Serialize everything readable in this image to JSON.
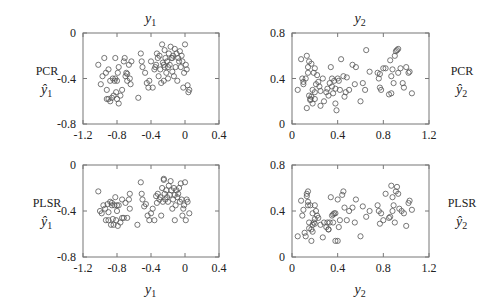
{
  "figure": {
    "panels_layout": "2x2",
    "marker": "open-circle",
    "marker_color": "#555555",
    "axis_color": "#777777",
    "text_color": "#222222"
  },
  "chart_data": [
    {
      "type": "scatter",
      "panel": "top-left",
      "title": "y1",
      "title_display": "y",
      "title_sub": "1",
      "row_label": "PCR",
      "row_label_math": "ŷ1",
      "row_label_math_base": "ŷ",
      "row_label_math_sub": "1",
      "row_label_side": "left",
      "xlabel": "",
      "ylabel": "PCR ŷ1",
      "xlim": [
        -1.2,
        0.4
      ],
      "ylim": [
        -0.8,
        0
      ],
      "xticks": [
        -1.2,
        -0.8,
        -0.4,
        0,
        0.4
      ],
      "xtick_labels": [
        "-1.2",
        "-0.8",
        "-0.4",
        "0",
        "0.4"
      ],
      "yticks": [
        0,
        -0.4,
        -0.8
      ],
      "ytick_labels": [
        "0",
        "-0.4",
        "-0.8"
      ],
      "grid": false,
      "x": [
        -1.02,
        -0.99,
        -0.97,
        -0.95,
        -0.93,
        -0.92,
        -0.9,
        -0.88,
        -0.86,
        -0.85,
        -0.84,
        -0.83,
        -0.82,
        -0.81,
        -0.8,
        -0.8,
        -0.79,
        -0.78,
        -0.76,
        -0.74,
        -0.72,
        -0.71,
        -0.7,
        -0.69,
        -0.68,
        -0.66,
        -0.65,
        -0.64,
        -0.63,
        -0.55,
        -0.52,
        -0.51,
        -0.5,
        -0.47,
        -0.45,
        -0.43,
        -0.42,
        -0.4,
        -0.38,
        -0.36,
        -0.34,
        -0.33,
        -0.32,
        -0.31,
        -0.3,
        -0.29,
        -0.28,
        -0.27,
        -0.26,
        -0.25,
        -0.24,
        -0.24,
        -0.23,
        -0.22,
        -0.21,
        -0.2,
        -0.2,
        -0.19,
        -0.18,
        -0.17,
        -0.16,
        -0.15,
        -0.14,
        -0.13,
        -0.12,
        -0.11,
        -0.1,
        -0.09,
        -0.08,
        -0.07,
        -0.06,
        -0.05,
        -0.04,
        -0.03,
        -0.02,
        -0.01,
        0,
        0.01,
        0.02,
        0.03,
        0.04,
        0.05,
        -0.88,
        -0.9,
        -0.82,
        -0.78,
        -0.92,
        -0.68,
        -0.25,
        -0.35,
        -0.15
      ],
      "y": [
        -0.28,
        -0.45,
        -0.38,
        -0.22,
        -0.35,
        -0.58,
        -0.32,
        -0.42,
        -0.57,
        -0.4,
        -0.55,
        -0.42,
        -0.22,
        -0.52,
        -0.42,
        -0.58,
        -0.35,
        -0.3,
        -0.55,
        -0.5,
        -0.25,
        -0.22,
        -0.38,
        -0.35,
        -0.42,
        -0.28,
        -0.4,
        -0.45,
        -0.25,
        -0.57,
        -0.18,
        -0.25,
        -0.3,
        -0.35,
        -0.44,
        -0.48,
        -0.42,
        -0.25,
        -0.48,
        -0.32,
        -0.28,
        -0.18,
        -0.22,
        -0.38,
        -0.2,
        -0.32,
        -0.44,
        -0.1,
        -0.26,
        -0.28,
        -0.15,
        -0.3,
        -0.22,
        -0.35,
        -0.25,
        -0.3,
        -0.4,
        -0.18,
        -0.28,
        -0.12,
        -0.22,
        -0.34,
        -0.2,
        -0.38,
        -0.14,
        -0.3,
        -0.18,
        -0.42,
        -0.22,
        -0.25,
        -0.16,
        -0.3,
        -0.2,
        -0.25,
        -0.48,
        -0.35,
        -0.1,
        -0.28,
        -0.32,
        -0.46,
        -0.52,
        -0.5,
        -0.6,
        -0.58,
        -0.4,
        -0.62,
        -0.5,
        -0.36,
        -0.42,
        -0.3,
        -0.22
      ]
    },
    {
      "type": "scatter",
      "panel": "top-right",
      "title": "y2",
      "title_display": "y",
      "title_sub": "2",
      "row_label": "PCR",
      "row_label_math": "ŷ2",
      "row_label_math_base": "ŷ",
      "row_label_math_sub": "2",
      "row_label_side": "right",
      "xlabel": "",
      "ylabel": "PCR ŷ2",
      "xlim": [
        0,
        1.2
      ],
      "ylim": [
        0,
        0.8
      ],
      "xticks": [
        0,
        0.4,
        0.8,
        1.2
      ],
      "xtick_labels": [
        "0",
        "0.4",
        "0.8",
        "1.2"
      ],
      "yticks": [
        0,
        0.4,
        0.8
      ],
      "ytick_labels": [
        "0",
        "0.4",
        "0.8"
      ],
      "grid": false,
      "x": [
        0.05,
        0.08,
        0.09,
        0.1,
        0.12,
        0.13,
        0.13,
        0.14,
        0.15,
        0.15,
        0.16,
        0.16,
        0.17,
        0.18,
        0.18,
        0.19,
        0.2,
        0.2,
        0.21,
        0.22,
        0.23,
        0.24,
        0.25,
        0.27,
        0.28,
        0.3,
        0.31,
        0.32,
        0.33,
        0.34,
        0.35,
        0.35,
        0.36,
        0.37,
        0.38,
        0.39,
        0.4,
        0.41,
        0.42,
        0.43,
        0.45,
        0.46,
        0.47,
        0.48,
        0.5,
        0.53,
        0.55,
        0.56,
        0.6,
        0.62,
        0.64,
        0.65,
        0.68,
        0.75,
        0.76,
        0.77,
        0.78,
        0.8,
        0.82,
        0.85,
        0.86,
        0.87,
        0.88,
        0.89,
        0.9,
        0.91,
        0.92,
        0.93,
        0.95,
        0.97,
        0.98,
        1.0,
        1.02,
        1.03,
        1.05,
        0.14,
        0.1,
        0.17,
        0.25,
        0.38,
        0.77,
        0.87,
        0.93,
        0.2
      ],
      "y": [
        0.3,
        0.57,
        0.4,
        0.35,
        0.4,
        0.6,
        0.14,
        0.5,
        0.25,
        0.55,
        0.22,
        0.21,
        0.53,
        0.18,
        0.3,
        0.45,
        0.28,
        0.49,
        0.35,
        0.43,
        0.37,
        0.33,
        0.16,
        0.4,
        0.2,
        0.28,
        0.31,
        0.25,
        0.36,
        0.5,
        0.4,
        0.33,
        0.27,
        0.38,
        0.18,
        0.12,
        0.4,
        0.38,
        0.3,
        0.57,
        0.42,
        0.24,
        0.28,
        0.41,
        0.3,
        0.52,
        0.35,
        0.5,
        0.2,
        0.36,
        0.3,
        0.65,
        0.46,
        0.45,
        0.4,
        0.32,
        0.3,
        0.49,
        0.49,
        0.26,
        0.56,
        0.42,
        0.48,
        0.36,
        0.6,
        0.64,
        0.65,
        0.45,
        0.49,
        0.36,
        0.32,
        0.5,
        0.45,
        0.46,
        0.27,
        0.45,
        0.37,
        0.24,
        0.29,
        0.31,
        0.44,
        0.27,
        0.66,
        0.22
      ]
    },
    {
      "type": "scatter",
      "panel": "bottom-left",
      "title": "",
      "row_label": "PLSR",
      "row_label_math": "ŷ1",
      "row_label_math_base": "ŷ",
      "row_label_math_sub": "1",
      "row_label_side": "left",
      "xlabel": "y1",
      "xlabel_display": "y",
      "xlabel_sub": "1",
      "ylabel": "PLSR ŷ1",
      "xlim": [
        -1.2,
        0.4
      ],
      "ylim": [
        -0.8,
        0
      ],
      "xticks": [
        -1.2,
        -0.8,
        -0.4,
        0,
        0.4
      ],
      "xtick_labels": [
        "-1.2",
        "-0.8",
        "-0.4",
        "0",
        "0.4"
      ],
      "yticks": [
        0,
        -0.4,
        -0.8
      ],
      "ytick_labels": [
        "0",
        "-0.4",
        "-0.8"
      ],
      "grid": false,
      "x": [
        -1.02,
        -1.0,
        -0.98,
        -0.96,
        -0.94,
        -0.93,
        -0.91,
        -0.9,
        -0.88,
        -0.87,
        -0.86,
        -0.85,
        -0.84,
        -0.83,
        -0.82,
        -0.81,
        -0.8,
        -0.79,
        -0.78,
        -0.76,
        -0.74,
        -0.72,
        -0.7,
        -0.68,
        -0.66,
        -0.65,
        -0.65,
        -0.56,
        -0.52,
        -0.51,
        -0.5,
        -0.48,
        -0.46,
        -0.44,
        -0.42,
        -0.4,
        -0.38,
        -0.36,
        -0.34,
        -0.33,
        -0.32,
        -0.3,
        -0.29,
        -0.28,
        -0.27,
        -0.26,
        -0.25,
        -0.24,
        -0.23,
        -0.22,
        -0.21,
        -0.2,
        -0.19,
        -0.18,
        -0.17,
        -0.16,
        -0.15,
        -0.14,
        -0.13,
        -0.12,
        -0.11,
        -0.1,
        -0.09,
        -0.08,
        -0.07,
        -0.06,
        -0.05,
        -0.04,
        -0.03,
        -0.02,
        -0.01,
        0,
        0.01,
        0.02,
        0.03,
        0.05,
        -0.86,
        -0.8,
        -0.9,
        -0.74,
        -0.25,
        -0.12
      ],
      "y": [
        -0.23,
        -0.4,
        -0.42,
        -0.35,
        -0.38,
        -0.48,
        -0.34,
        -0.48,
        -0.32,
        -0.52,
        -0.35,
        -0.47,
        -0.52,
        -0.35,
        -0.28,
        -0.48,
        -0.4,
        -0.53,
        -0.35,
        -0.5,
        -0.3,
        -0.46,
        -0.33,
        -0.46,
        -0.3,
        -0.38,
        -0.25,
        -0.52,
        -0.15,
        -0.25,
        -0.3,
        -0.36,
        -0.34,
        -0.44,
        -0.48,
        -0.42,
        -0.38,
        -0.48,
        -0.27,
        -0.33,
        -0.25,
        -0.3,
        -0.28,
        -0.44,
        -0.2,
        -0.32,
        -0.12,
        -0.25,
        -0.3,
        -0.22,
        -0.28,
        -0.32,
        -0.18,
        -0.26,
        -0.14,
        -0.22,
        -0.38,
        -0.3,
        -0.2,
        -0.26,
        -0.35,
        -0.22,
        -0.28,
        -0.25,
        -0.2,
        -0.32,
        -0.16,
        -0.3,
        -0.44,
        -0.38,
        -0.35,
        -0.15,
        -0.48,
        -0.3,
        -0.32,
        -0.42,
        -0.33,
        -0.35,
        -0.41,
        -0.46,
        -0.13,
        -0.48
      ]
    },
    {
      "type": "scatter",
      "panel": "bottom-right",
      "title": "",
      "row_label": "PLSR",
      "row_label_math": "ŷ2",
      "row_label_math_base": "ŷ",
      "row_label_math_sub": "2",
      "row_label_side": "right",
      "xlabel": "y2",
      "xlabel_display": "y",
      "xlabel_sub": "2",
      "ylabel": "PLSR ŷ2",
      "xlim": [
        0,
        1.2
      ],
      "ylim": [
        0,
        0.8
      ],
      "xticks": [
        0,
        0.4,
        0.8,
        1.2
      ],
      "xtick_labels": [
        "0",
        "0.4",
        "0.8",
        "1.2"
      ],
      "yticks": [
        0,
        0.4,
        0.8
      ],
      "ytick_labels": [
        "0",
        "0.4",
        "0.8"
      ],
      "grid": false,
      "x": [
        0.05,
        0.08,
        0.09,
        0.1,
        0.11,
        0.12,
        0.13,
        0.14,
        0.14,
        0.15,
        0.15,
        0.16,
        0.17,
        0.17,
        0.18,
        0.18,
        0.19,
        0.2,
        0.2,
        0.21,
        0.22,
        0.23,
        0.25,
        0.27,
        0.28,
        0.3,
        0.31,
        0.32,
        0.33,
        0.34,
        0.35,
        0.36,
        0.37,
        0.38,
        0.38,
        0.4,
        0.41,
        0.42,
        0.44,
        0.45,
        0.46,
        0.48,
        0.5,
        0.53,
        0.55,
        0.56,
        0.6,
        0.62,
        0.65,
        0.68,
        0.75,
        0.76,
        0.77,
        0.78,
        0.8,
        0.82,
        0.85,
        0.86,
        0.87,
        0.88,
        0.89,
        0.9,
        0.91,
        0.92,
        0.93,
        0.94,
        0.96,
        0.98,
        1.0,
        1.02,
        1.03,
        1.05,
        0.13,
        0.14,
        0.18,
        0.2,
        0.32,
        0.36,
        0.4,
        0.88
      ],
      "y": [
        0.18,
        0.49,
        0.36,
        0.41,
        0.21,
        0.18,
        0.55,
        0.48,
        0.57,
        0.3,
        0.25,
        0.45,
        0.14,
        0.24,
        0.28,
        0.38,
        0.3,
        0.45,
        0.33,
        0.4,
        0.36,
        0.34,
        0.28,
        0.17,
        0.3,
        0.26,
        0.3,
        0.24,
        0.3,
        0.52,
        0.36,
        0.3,
        0.38,
        0.14,
        0.38,
        0.5,
        0.26,
        0.32,
        0.54,
        0.57,
        0.43,
        0.32,
        0.4,
        0.43,
        0.3,
        0.5,
        0.18,
        0.44,
        0.35,
        0.4,
        0.45,
        0.4,
        0.29,
        0.38,
        0.32,
        0.55,
        0.34,
        0.35,
        0.62,
        0.4,
        0.45,
        0.3,
        0.57,
        0.61,
        0.55,
        0.42,
        0.4,
        0.38,
        0.27,
        0.47,
        0.49,
        0.41,
        0.53,
        0.45,
        0.22,
        0.29,
        0.24,
        0.37,
        0.14,
        0.52
      ]
    }
  ]
}
